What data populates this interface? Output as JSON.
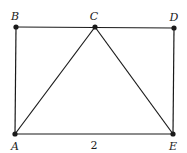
{
  "diagram": {
    "type": "geometry",
    "stroke_color": "#1a1a1a",
    "background": "#ffffff",
    "points": {
      "A": {
        "label": "A",
        "x": 15,
        "y": 134
      },
      "B": {
        "label": "B",
        "x": 16,
        "y": 27
      },
      "C": {
        "label": "C",
        "x": 95,
        "y": 27
      },
      "D": {
        "label": "D",
        "x": 174,
        "y": 28
      },
      "E": {
        "label": "E",
        "x": 173,
        "y": 134
      }
    },
    "segments": [
      [
        "A",
        "B"
      ],
      [
        "B",
        "C"
      ],
      [
        "C",
        "D"
      ],
      [
        "D",
        "E"
      ],
      [
        "E",
        "A"
      ],
      [
        "A",
        "C"
      ],
      [
        "C",
        "E"
      ]
    ],
    "measure_label": "2"
  }
}
